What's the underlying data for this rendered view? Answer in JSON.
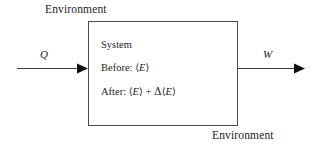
{
  "diagram": {
    "background_color": "#ffffff",
    "line_color": "#4a4a52",
    "text_color": "#242424"
  },
  "labels": {
    "environment_top": "Environment",
    "environment_bottom": "Environment"
  },
  "system_box": {
    "heading": "System",
    "line_before": {
      "prefix": "Before:",
      "open_angle": "⟨",
      "variable": "E",
      "close_angle": "⟩"
    },
    "line_after": {
      "prefix": "After:",
      "open_angle": "⟨",
      "variable": "E",
      "close_angle": "⟩",
      "operator": "+",
      "delta": "Δ",
      "open_angle_2": "⟨",
      "variable_2": "E",
      "close_angle_2": "⟩"
    }
  },
  "flows": {
    "heat_in": {
      "symbol": "Q",
      "direction": "into-system",
      "side": "left"
    },
    "work_out": {
      "symbol": "W",
      "direction": "out-of-system",
      "side": "right"
    }
  }
}
